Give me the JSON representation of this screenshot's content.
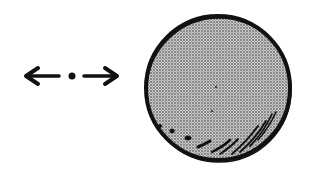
{
  "figure": {
    "colors": {
      "background": "#ffffff",
      "ink": "#111111",
      "sphere_fill": "#a9a9a9"
    },
    "left_symbol": {
      "items": [
        "left-arrow",
        "dot",
        "right-arrow"
      ]
    },
    "sphere": {
      "shading": "halftone-stipple",
      "highlights": "hatch-strokes-bottom-right"
    }
  }
}
